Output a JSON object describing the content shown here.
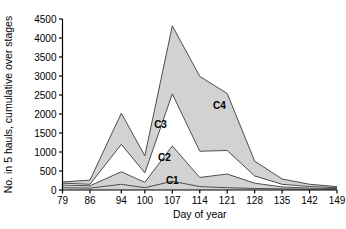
{
  "chart_data": {
    "type": "area",
    "stacked": true,
    "title": "",
    "subtitle": "",
    "xlabel": "Day of year",
    "ylabel": "No. in 5 hauls, cumulative over stages",
    "x": [
      79,
      86,
      94,
      100,
      107,
      114,
      121,
      128,
      135,
      142,
      149
    ],
    "xtick_labels": [
      "79",
      "86",
      "94",
      "100",
      "107",
      "114",
      "121",
      "128",
      "135",
      "142",
      "149"
    ],
    "ytick_labels": [
      "0",
      "500",
      "1000",
      "1500",
      "2000",
      "2500",
      "3000",
      "3500",
      "4000",
      "4500"
    ],
    "yticks": [
      0,
      500,
      1000,
      1500,
      2000,
      2500,
      3000,
      3500,
      4000,
      4500
    ],
    "ylim": [
      0,
      4500
    ],
    "xlim": [
      79,
      149
    ],
    "grid": false,
    "legend": "in-plot labels",
    "annotations": [
      {
        "text": "C1",
        "x": 107,
        "y": 170
      },
      {
        "text": "C2",
        "x": 105,
        "y": 760
      },
      {
        "text": "C3",
        "x": 104,
        "y": 1640
      },
      {
        "text": "C4",
        "x": 119,
        "y": 2130
      }
    ],
    "cumulative_boundaries": {
      "C1": [
        60,
        50,
        150,
        60,
        230,
        90,
        60,
        40,
        30,
        20,
        20
      ],
      "C1_plus_C2": [
        130,
        110,
        480,
        200,
        1160,
        330,
        420,
        180,
        80,
        50,
        40
      ],
      "C1_C2_C3": [
        180,
        150,
        1200,
        450,
        2530,
        1020,
        1040,
        370,
        150,
        90,
        60
      ],
      "C1_C2_C3_C4": [
        210,
        260,
        2020,
        900,
        4320,
        2990,
        2540,
        760,
        290,
        150,
        90
      ]
    },
    "series": [
      {
        "name": "C1",
        "fill": "#d2d2d2",
        "values": [
          60,
          50,
          150,
          60,
          230,
          90,
          60,
          40,
          30,
          20,
          20
        ]
      },
      {
        "name": "C2",
        "fill": "#d2d2d2",
        "values": [
          70,
          60,
          330,
          140,
          930,
          240,
          360,
          140,
          50,
          30,
          20
        ]
      },
      {
        "name": "C3",
        "fill": "#ffffff",
        "values": [
          50,
          40,
          720,
          250,
          1370,
          690,
          620,
          190,
          70,
          40,
          20
        ]
      },
      {
        "name": "C4",
        "fill": "#d2d2d2",
        "values": [
          30,
          110,
          820,
          450,
          1790,
          1970,
          1500,
          390,
          140,
          60,
          30
        ]
      }
    ],
    "colors": {
      "shaded_band": "#d2d2d2",
      "open_band": "#ffffff",
      "outline": "#4d4d4d",
      "axis": "#000000",
      "text": "#000000"
    }
  }
}
